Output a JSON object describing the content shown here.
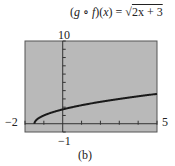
{
  "chart_data": {
    "type": "line",
    "caption": "(b)",
    "xlabel": "",
    "ylabel": "",
    "xlim": [
      -2,
      5
    ],
    "ylim": [
      -1,
      10
    ],
    "xtick_step": 1,
    "ytick_step": 1,
    "grid": false,
    "background": "#b9b9b9",
    "line_color": "#1a1a1a",
    "window_labels": {
      "xmin": "−2",
      "xmax": "5",
      "ymin": "−1",
      "ymax": "10"
    },
    "series": [
      {
        "name": "sqrt(2x+3)",
        "x": [
          -1.5,
          -1.4,
          -1.2,
          -1.0,
          -0.5,
          0,
          1,
          2,
          3,
          4,
          5
        ],
        "y": [
          0,
          0.447,
          0.775,
          1.0,
          1.414,
          1.732,
          2.236,
          2.646,
          3.0,
          3.317,
          3.606
        ]
      }
    ]
  },
  "title": {
    "lhs_g": "g",
    "compose": " ∘ ",
    "lhs_f": "f",
    "lhs_x": "x",
    "rhs": "2x + 3"
  },
  "labels": {
    "ymax": "10",
    "ymin": "−1",
    "xmin": "−2",
    "xmax": "5"
  },
  "caption": "(b)"
}
